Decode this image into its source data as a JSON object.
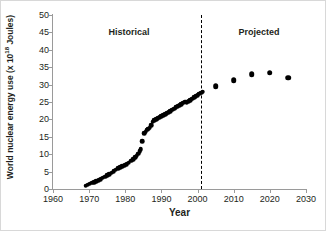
{
  "chart_data": {
    "type": "scatter",
    "title": "",
    "xlabel": "Year",
    "ylabel": "World nuclear energy use (x 10",
    "ylabel_exponent": "18",
    "ylabel_suffix": " Joules)",
    "xlim": [
      1960,
      2030
    ],
    "ylim": [
      0,
      50
    ],
    "xticks": [
      1960,
      1970,
      1980,
      1990,
      2000,
      2010,
      2020,
      2030
    ],
    "yticks": [
      0,
      5,
      10,
      15,
      20,
      25,
      30,
      35,
      40,
      45,
      50
    ],
    "grid": false,
    "legend": "none",
    "annotations": [
      {
        "text": "Historical",
        "x": 1981,
        "y": 46.5
      },
      {
        "text": "Projected",
        "x": 2017,
        "y": 46.5
      }
    ],
    "reference_lines": [
      {
        "orientation": "vertical",
        "x": 2001,
        "style": "dashed",
        "color": "#000000"
      }
    ],
    "series": [
      {
        "name": "Historical",
        "marker": "filled-circle",
        "color": "#000000",
        "points": [
          [
            1969.0,
            0.9
          ],
          [
            1969.6,
            1.2
          ],
          [
            1970.2,
            1.5
          ],
          [
            1970.8,
            1.8
          ],
          [
            1971.4,
            2.0
          ],
          [
            1972.0,
            2.3
          ],
          [
            1972.6,
            2.6
          ],
          [
            1973.2,
            2.9
          ],
          [
            1973.8,
            3.2
          ],
          [
            1974.4,
            3.5
          ],
          [
            1975.0,
            3.9
          ],
          [
            1975.6,
            4.3
          ],
          [
            1976.2,
            4.7
          ],
          [
            1976.8,
            5.1
          ],
          [
            1977.4,
            5.5
          ],
          [
            1978.0,
            5.9
          ],
          [
            1978.6,
            6.3
          ],
          [
            1979.2,
            6.6
          ],
          [
            1979.8,
            6.9
          ],
          [
            1980.4,
            7.2
          ],
          [
            1981.0,
            7.6
          ],
          [
            1981.6,
            8.1
          ],
          [
            1982.2,
            8.6
          ],
          [
            1982.8,
            9.1
          ],
          [
            1983.2,
            9.6
          ],
          [
            1983.6,
            10.2
          ],
          [
            1984.0,
            10.8
          ],
          [
            1984.3,
            11.4
          ],
          [
            1984.6,
            13.7
          ],
          [
            1985.2,
            16.0
          ],
          [
            1985.6,
            16.5
          ],
          [
            1986.0,
            17.0
          ],
          [
            1986.4,
            17.3
          ],
          [
            1986.8,
            17.6
          ],
          [
            1987.2,
            18.4
          ],
          [
            1987.6,
            19.3
          ],
          [
            1988.0,
            19.8
          ],
          [
            1988.5,
            20.1
          ],
          [
            1989.0,
            20.3
          ],
          [
            1989.5,
            20.6
          ],
          [
            1990.0,
            20.9
          ],
          [
            1990.5,
            21.2
          ],
          [
            1991.0,
            21.5
          ],
          [
            1991.5,
            21.8
          ],
          [
            1992.0,
            22.1
          ],
          [
            1992.5,
            22.4
          ],
          [
            1993.0,
            22.8
          ],
          [
            1993.5,
            23.1
          ],
          [
            1994.0,
            23.5
          ],
          [
            1994.5,
            23.8
          ],
          [
            1995.0,
            24.1
          ],
          [
            1995.5,
            24.4
          ],
          [
            1996.0,
            24.8
          ],
          [
            1996.5,
            25.1
          ],
          [
            1997.0,
            25.0
          ],
          [
            1997.5,
            25.2
          ],
          [
            1998.0,
            25.6
          ],
          [
            1998.5,
            25.9
          ],
          [
            1999.0,
            26.3
          ],
          [
            1999.5,
            26.6
          ],
          [
            2000.0,
            27.0
          ],
          [
            2000.5,
            27.4
          ],
          [
            2001.0,
            27.7
          ],
          [
            2001.4,
            28.0
          ]
        ]
      },
      {
        "name": "Projected",
        "marker": "filled-circle",
        "color": "#000000",
        "points": [
          [
            2005,
            29.5
          ],
          [
            2010,
            31.3
          ],
          [
            2015,
            33.0
          ],
          [
            2020,
            33.4
          ],
          [
            2025,
            32.0
          ]
        ]
      }
    ]
  }
}
